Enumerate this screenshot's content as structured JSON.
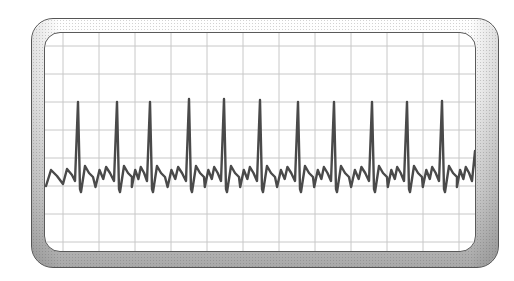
{
  "monitor": {
    "type": "ecg-heart-monitor-illustration",
    "frame_color_top": "#ffffff",
    "frame_color_bottom": "#a8a8a8",
    "outline_color": "#555555",
    "screen_background": "#ffffff",
    "grid_color": "#c8c8c8",
    "trace_color": "#4a4a4a"
  },
  "grid": {
    "vertical_lines_x": [
      62,
      98,
      134,
      170,
      206,
      242,
      278,
      314,
      350,
      386,
      422,
      458
    ],
    "horizontal_lines_y": [
      45,
      73,
      101,
      129,
      157,
      185,
      213,
      241
    ]
  },
  "ecg_trace": {
    "baseline_y": 180,
    "r_peaks": [
      {
        "x": 77,
        "y": 101
      },
      {
        "x": 116,
        "y": 101
      },
      {
        "x": 149,
        "y": 101
      },
      {
        "x": 188,
        "y": 98
      },
      {
        "x": 223,
        "y": 98
      },
      {
        "x": 259,
        "y": 99
      },
      {
        "x": 297,
        "y": 101
      },
      {
        "x": 333,
        "y": 101
      },
      {
        "x": 371,
        "y": 101
      },
      {
        "x": 406,
        "y": 101
      },
      {
        "x": 441,
        "y": 100
      },
      {
        "x": 474,
        "y": 150
      }
    ]
  }
}
